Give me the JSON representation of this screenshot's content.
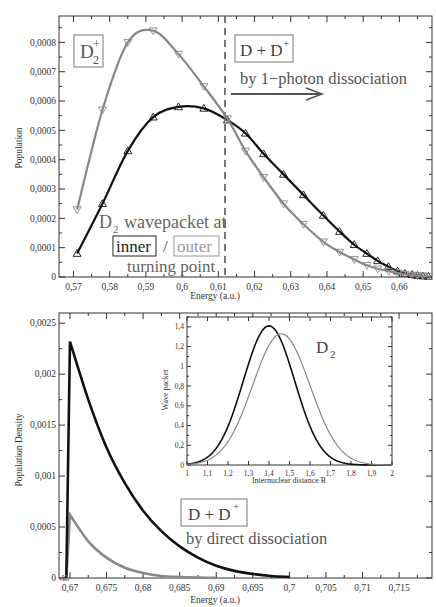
{
  "chart_data": [
    {
      "type": "line",
      "title": "",
      "xlabel": "Energy (a.u.)",
      "ylabel": "Population",
      "xlim": [
        0.566,
        0.669
      ],
      "ylim": [
        0,
        0.00089
      ],
      "xticks": [
        "0,57",
        "0,58",
        "0,59",
        "0,6",
        "0,61",
        "0,62",
        "0,63",
        "0,64",
        "0,65",
        "0,66"
      ],
      "yticks": [
        "0",
        "0,0001",
        "0,0002",
        "0,0003",
        "0,0004",
        "0,0005",
        "0,0006",
        "0,0007",
        "0,0008"
      ],
      "grid": false,
      "vline": {
        "x": 0.6135,
        "style": "dashed"
      },
      "series": [
        {
          "name": "inner turning point",
          "color": "#111111",
          "marker": "triangle-up",
          "x": [
            0.571,
            0.578,
            0.585,
            0.592,
            0.599,
            0.606,
            0.6125,
            0.6175,
            0.6225,
            0.628,
            0.6335,
            0.639,
            0.6435,
            0.6475,
            0.651,
            0.654,
            0.657,
            0.6595,
            0.6615,
            0.6635,
            0.665,
            0.6665,
            0.668
          ],
          "y": [
            8e-05,
            0.00025,
            0.00043,
            0.000545,
            0.00058,
            0.000575,
            0.000535,
            0.00049,
            0.00042,
            0.00035,
            0.00028,
            0.00021,
            0.000155,
            0.00011,
            8e-05,
            5.5e-05,
            3.5e-05,
            2e-05,
            1.2e-05,
            8e-06,
            5e-06,
            3e-06,
            2e-06
          ]
        },
        {
          "name": "outer turning point",
          "color": "#888888",
          "marker": "triangle-down",
          "x": [
            0.571,
            0.578,
            0.585,
            0.592,
            0.599,
            0.606,
            0.6125,
            0.6175,
            0.6225,
            0.628,
            0.6335,
            0.639,
            0.6435,
            0.6475,
            0.651,
            0.654,
            0.657,
            0.6595,
            0.6615,
            0.6635,
            0.665,
            0.6665,
            0.668
          ],
          "y": [
            0.00023,
            0.00057,
            0.0008,
            0.00084,
            0.00076,
            0.00065,
            0.00054,
            0.00043,
            0.00034,
            0.00025,
            0.00018,
            0.00012,
            8.5e-05,
            6e-05,
            4e-05,
            2.8e-05,
            2e-05,
            1.4e-05,
            1e-05,
            7e-06,
            5e-06,
            4e-06,
            3e-06
          ]
        }
      ],
      "annotations": [
        {
          "text": "D2+",
          "boxed": true
        },
        {
          "text": "D + D+",
          "boxed": true
        },
        {
          "text": "by 1-photon dissociation",
          "arrow": "right"
        },
        {
          "text": "D2 wavepacket at"
        },
        {
          "text": "inner / outer"
        },
        {
          "text": "turning point"
        }
      ]
    },
    {
      "type": "line",
      "title": "",
      "xlabel": "Energy (a.u.)",
      "ylabel": "Population Density",
      "xlim": [
        0.6685,
        0.7195
      ],
      "ylim": [
        0,
        0.0026
      ],
      "xticks": [
        "0,67",
        "0,675",
        "0,68",
        "0,685",
        "0,69",
        "0,695",
        "0,7",
        "0,705",
        "0,71",
        "0,715"
      ],
      "yticks": [
        "0",
        "0,0005",
        "0,001",
        "0,0015",
        "0,002",
        "0,0025"
      ],
      "grid": false,
      "series": [
        {
          "name": "inner turning point",
          "color": "#111111",
          "x": [
            0.6695,
            0.67,
            0.6725,
            0.675,
            0.6775,
            0.68,
            0.6825,
            0.685,
            0.6875,
            0.69,
            0.6925,
            0.695,
            0.6975,
            0.7
          ],
          "y": [
            0,
            0.00232,
            0.00175,
            0.00128,
            0.00093,
            0.00066,
            0.00046,
            0.00031,
            0.0002,
            0.00012,
            7e-05,
            4e-05,
            2e-05,
            1e-05
          ]
        },
        {
          "name": "outer turning point",
          "color": "#888888",
          "x": [
            0.6695,
            0.67,
            0.6725,
            0.675,
            0.6775,
            0.68,
            0.6825,
            0.685,
            0.6875,
            0.69
          ],
          "y": [
            0,
            0.00062,
            0.00036,
            0.0002,
            0.0001,
            5e-05,
            2e-05,
            1e-05,
            4e-06,
            1e-06
          ]
        }
      ],
      "annotations": [
        {
          "text": "D + D+",
          "boxed": true
        },
        {
          "text": "by direct dissociation"
        }
      ]
    },
    {
      "type": "line",
      "title": "",
      "inset": true,
      "xlabel": "Internuclear distance R",
      "ylabel": "Wave packet",
      "xlim": [
        1,
        2
      ],
      "ylim": [
        0,
        1.5
      ],
      "xticks": [
        "1",
        "1,1",
        "1,2",
        "1,3",
        "1,4",
        "1,5",
        "1,6",
        "1,7",
        "1,8",
        "1,9",
        "2"
      ],
      "yticks": [
        "0",
        "0,2",
        "0,4",
        "0,6",
        "0,8",
        "1",
        "1,2",
        "1,4"
      ],
      "series": [
        {
          "name": "inner",
          "color": "#111111",
          "shape": "gaussian",
          "center": 1.4,
          "peak": 1.41,
          "sigma": 0.125
        },
        {
          "name": "outer",
          "color": "#888888",
          "shape": "gaussian",
          "center": 1.46,
          "peak": 1.33,
          "sigma": 0.14
        }
      ],
      "annotations": [
        {
          "text": "D2"
        }
      ]
    }
  ],
  "labels": {
    "top": {
      "xlabel": "Energy (a.u.)",
      "ylabel": "Population",
      "d2plus_main": "D",
      "d2plus_sub": "2",
      "d2plus_sup": "+",
      "ddplus": "D + D",
      "ddplus_sup": "+",
      "photon": "by 1−photon dissociation",
      "wp_D": "D",
      "wp_sub": "2",
      "wp_rest": "wavepacket at",
      "inner": "inner",
      "slash": "/",
      "outer": "outer",
      "turning": "turning point"
    },
    "bottom": {
      "xlabel": "Energy (a.u.)",
      "ylabel": "Population Density",
      "ddplus": "D + D",
      "ddplus_sup": "+",
      "direct": "by direct dissociation"
    },
    "inset": {
      "xlabel": "Internuclear distance R",
      "ylabel": "Wave packet",
      "d2_main": "D",
      "d2_sub": "2"
    }
  }
}
